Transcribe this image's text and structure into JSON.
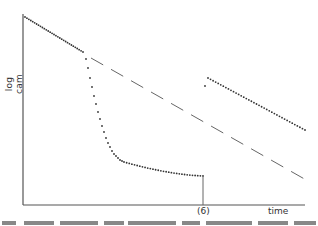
{
  "chart_data": {
    "type": "scatter",
    "title": "",
    "xlabel": "time",
    "ylabel": "log cam",
    "x_ticks": [
      "(6)"
    ],
    "grid": false,
    "legend": null,
    "axis_ranges": {
      "x": [
        0,
        1
      ],
      "y": [
        0,
        1
      ]
    },
    "series": [
      {
        "name": "initial decline",
        "style": "dotted",
        "points": [
          [
            0.01,
            0.98
          ],
          [
            0.21,
            0.8
          ]
        ]
      },
      {
        "name": "rapid drop to plateau",
        "style": "dotted",
        "points": [
          [
            0.22,
            0.76
          ],
          [
            0.24,
            0.66
          ],
          [
            0.26,
            0.57
          ],
          [
            0.28,
            0.48
          ],
          [
            0.3,
            0.4
          ],
          [
            0.33,
            0.3
          ],
          [
            0.38,
            0.22
          ],
          [
            0.45,
            0.18
          ],
          [
            0.55,
            0.16
          ],
          [
            0.64,
            0.15
          ]
        ]
      },
      {
        "name": "extrapolated decline",
        "style": "dashed",
        "points": [
          [
            0.24,
            0.77
          ],
          [
            1.0,
            0.13
          ]
        ]
      },
      {
        "name": "recovery",
        "style": "dotted",
        "points": [
          [
            0.64,
            0.62
          ],
          [
            0.65,
            0.66
          ],
          [
            0.99,
            0.39
          ]
        ]
      }
    ],
    "annotations": [
      {
        "text": "(6)",
        "x": 0.64,
        "note": "vertical marker line at event"
      }
    ]
  },
  "labels": {
    "ylabel": "log cam",
    "xlabel": "time",
    "marker": "(6)"
  },
  "colors": {
    "axis": "#555555",
    "dots": "#333333",
    "dashed": "#666666"
  }
}
